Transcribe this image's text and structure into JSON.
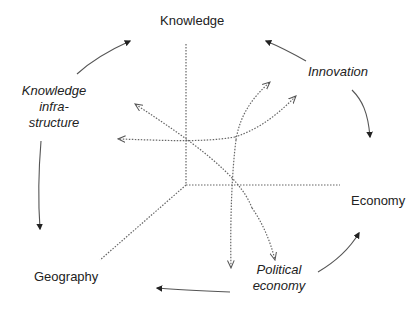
{
  "diagram": {
    "axes_labels": {
      "knowledge": "Knowledge",
      "economy": "Economy",
      "geography": "Geography"
    },
    "process_labels": {
      "knowledge_infrastructure": [
        "Knowledge",
        "infra-",
        "structure"
      ],
      "innovation": "Innovation",
      "political_economy": [
        "Political",
        "economy"
      ]
    },
    "colors": {
      "text": "#222222",
      "solid_arrow": "#555555",
      "dotted_line": "#666666"
    }
  }
}
